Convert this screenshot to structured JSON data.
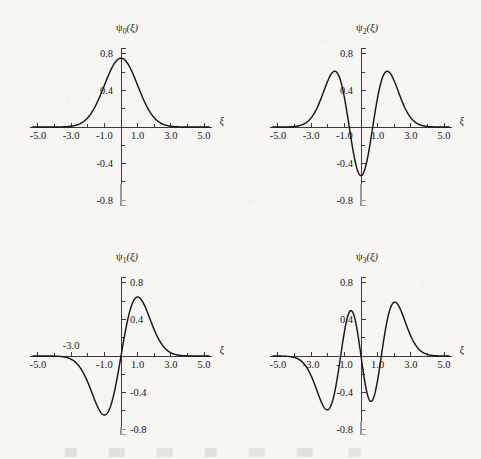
{
  "figure": {
    "background_color": "#f7f6f2",
    "ink_color": "#191919",
    "curve_color": "#161616",
    "axis_color": "#3a3a3a",
    "axis_faint_color": "#9a9a9a",
    "panel_count": 4,
    "grid": "2x2"
  },
  "axis_common": {
    "x_axis_label": "ξ",
    "x_tick_labels": [
      "-5.0",
      "-3.0",
      "-1.0",
      "1.0",
      "3.0",
      "5.0"
    ],
    "x_tick_values": [
      -5.0,
      -3.0,
      -1.0,
      1.0,
      3.0,
      5.0
    ],
    "x_minor_tick_values": [
      -4.0,
      -2.0,
      0.0,
      2.0,
      4.0
    ],
    "y_tick_labels": [
      "0.8",
      "0.4",
      "-0.4",
      "-0.8"
    ],
    "y_tick_values": [
      0.8,
      0.4,
      -0.4,
      -0.8
    ],
    "y_minor_tick_values": [
      0.6,
      0.2,
      -0.2,
      -0.6
    ],
    "xlim": [
      -5.6,
      5.6
    ],
    "ylim": [
      -0.95,
      0.95
    ],
    "grid": false,
    "legend": "none"
  },
  "panels": [
    {
      "id": "psi0",
      "position": "top-left",
      "title": "ψ₀(ξ)",
      "title_sub": "0",
      "y_label_side": "left",
      "x_label_above_axis": [],
      "faint_axis_below": -0.62
    },
    {
      "id": "psi2",
      "position": "top-right",
      "title": "ψ₂(ξ)",
      "title_sub": "2",
      "y_label_side": "left",
      "x_label_above_axis": [],
      "faint_axis_below": -0.62
    },
    {
      "id": "psi1",
      "position": "bottom-left",
      "title": "ψ₁(ξ)",
      "title_sub": "1",
      "y_label_side": "right",
      "x_label_above_axis": [
        -3.0
      ],
      "faint_axis_below": -0.78
    },
    {
      "id": "psi3",
      "position": "bottom-right",
      "title": "ψ₃(ξ)",
      "title_sub": "3",
      "y_label_side": "left",
      "x_label_above_axis": [],
      "faint_axis_below": -0.72
    }
  ],
  "chart_data": [
    {
      "type": "line",
      "id": "psi0",
      "title": "ψ₀(ξ)",
      "xlabel": "ξ",
      "ylabel": "ψ₀(ξ)",
      "xlim": [
        -5.6,
        5.6
      ],
      "ylim": [
        -0.95,
        0.95
      ],
      "grid": false,
      "legend": "none",
      "hermite_order": 0,
      "formula": "pi^(-1/4) * exp(-xi^2/2)",
      "nodes": [],
      "peak_value": 0.751,
      "peak_x": 0.0,
      "min_value": 0.0,
      "x": [
        -5.0,
        -4.5,
        -4.0,
        -3.5,
        -3.0,
        -2.5,
        -2.0,
        -1.5,
        -1.0,
        -0.5,
        0.0,
        0.5,
        1.0,
        1.5,
        2.0,
        2.5,
        3.0,
        3.5,
        4.0,
        4.5,
        5.0
      ],
      "y": [
        0.0,
        0.003,
        0.002,
        0.016,
        0.008,
        0.031,
        0.102,
        0.244,
        0.456,
        0.663,
        0.751,
        0.663,
        0.456,
        0.244,
        0.102,
        0.031,
        0.008,
        0.016,
        0.002,
        0.003,
        0.0
      ]
    },
    {
      "type": "line",
      "id": "psi1",
      "title": "ψ₁(ξ)",
      "xlabel": "ξ",
      "ylabel": "ψ₁(ξ)",
      "xlim": [
        -5.6,
        5.6
      ],
      "ylim": [
        -0.95,
        0.95
      ],
      "grid": false,
      "legend": "none",
      "hermite_order": 1,
      "formula": "pi^(-1/4) * sqrt(2) * xi * exp(-xi^2/2)",
      "nodes": [
        0.0
      ],
      "peak_value": 0.644,
      "peak_x": 1.0,
      "min_value": -0.644,
      "min_x": -1.0,
      "x": [
        -5.0,
        -4.5,
        -4.0,
        -3.5,
        -3.0,
        -2.5,
        -2.0,
        -1.5,
        -1.0,
        -0.5,
        0.0,
        0.5,
        1.0,
        1.5,
        2.0,
        2.5,
        3.0,
        3.5,
        4.0,
        4.5,
        5.0
      ],
      "y": [
        -0.0,
        -0.003,
        -0.011,
        -0.036,
        -0.105,
        -0.254,
        -0.394,
        -0.517,
        -0.644,
        -0.469,
        0.0,
        0.469,
        0.644,
        0.517,
        0.394,
        0.254,
        0.105,
        0.036,
        0.011,
        0.003,
        0.0
      ]
    },
    {
      "type": "line",
      "id": "psi2",
      "title": "ψ₂(ξ)",
      "xlabel": "ξ",
      "ylabel": "ψ₂(ξ)",
      "xlim": [
        -5.6,
        5.6
      ],
      "ylim": [
        -0.95,
        0.95
      ],
      "grid": false,
      "legend": "none",
      "hermite_order": 2,
      "formula": "pi^(-1/4)/sqrt(2) * (2*xi^2-1) * exp(-xi^2/2)",
      "nodes": [
        -0.707,
        0.707
      ],
      "peak_value": 0.602,
      "peak_x": 1.32,
      "min_value": -0.531,
      "min_x": 0.0,
      "x": [
        -5.0,
        -4.5,
        -4.0,
        -3.5,
        -3.0,
        -2.5,
        -2.0,
        -1.5,
        -1.0,
        -0.5,
        0.0,
        0.5,
        1.0,
        1.5,
        2.0,
        2.5,
        3.0,
        3.5,
        4.0,
        4.5,
        5.0
      ],
      "y": [
        0.0,
        0.002,
        0.01,
        0.038,
        0.106,
        0.264,
        0.424,
        0.58,
        0.383,
        -0.247,
        -0.531,
        -0.247,
        0.383,
        0.58,
        0.424,
        0.264,
        0.106,
        0.038,
        0.01,
        0.002,
        0.0
      ]
    },
    {
      "type": "line",
      "id": "psi3",
      "title": "ψ₃(ξ)",
      "xlabel": "ξ",
      "ylabel": "ψ₃(ξ)",
      "xlim": [
        -5.6,
        5.6
      ],
      "ylim": [
        -0.95,
        0.95
      ],
      "grid": false,
      "legend": "none",
      "hermite_order": 3,
      "formula": "pi^(-1/4)/sqrt(3) * (2*xi^3-3*xi) * exp(-xi^2/2)",
      "nodes": [
        -1.225,
        0.0,
        1.225
      ],
      "peak_value": 0.604,
      "peak_x": 2.05,
      "min_value": -0.604,
      "min_x": -2.05,
      "x": [
        -5.0,
        -4.5,
        -4.0,
        -3.5,
        -3.0,
        -2.5,
        -2.0,
        -1.5,
        -1.0,
        -0.5,
        0.0,
        0.5,
        1.0,
        1.5,
        2.0,
        2.5,
        3.0,
        3.5,
        4.0,
        4.5,
        5.0
      ],
      "y": [
        -0.001,
        -0.006,
        -0.026,
        -0.093,
        -0.241,
        -0.474,
        -0.603,
        -0.382,
        0.232,
        0.48,
        0.0,
        -0.48,
        -0.232,
        0.382,
        0.603,
        0.474,
        0.241,
        0.093,
        0.026,
        0.006,
        0.001
      ]
    }
  ]
}
